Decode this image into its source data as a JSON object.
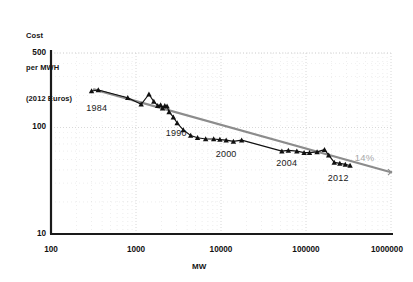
{
  "chart_data": {
    "type": "line",
    "title": "",
    "xlabel": "MW",
    "ylabel": "Cost\nper MWH\n(2012 Euros)",
    "ylabel_lines": [
      "Cost",
      "per MWH",
      "(2012 Euros)"
    ],
    "xscale": "log",
    "yscale": "log",
    "xlim": [
      100,
      1000000
    ],
    "ylim": [
      10,
      500
    ],
    "grid": true,
    "legend": "none",
    "xticks": [
      "100",
      "1000",
      "10000",
      "100000",
      "1000000"
    ],
    "xtick_values": [
      100,
      1000,
      10000,
      100000,
      1000000
    ],
    "yticks": [
      "10",
      "100",
      "500"
    ],
    "ytick_values": [
      10,
      100,
      500
    ],
    "series": [
      {
        "name": "Observed cost",
        "marker": "triangle",
        "color": "#111111",
        "x": [
          300,
          360,
          800,
          1150,
          1420,
          1620,
          1800,
          1950,
          2050,
          2180,
          2320,
          2450,
          2750,
          3050,
          3600,
          4400,
          5300,
          6600,
          8200,
          9700,
          11500,
          14000,
          17500,
          52000,
          62000,
          78000,
          95000,
          110000,
          135000,
          165000,
          185000,
          215000,
          250000,
          290000,
          330000
        ],
        "y": [
          220,
          225,
          190,
          165,
          205,
          175,
          160,
          163,
          152,
          160,
          158,
          140,
          125,
          110,
          95,
          84,
          80,
          78,
          78,
          77,
          76,
          74,
          76,
          60,
          61,
          60,
          58,
          58,
          59,
          62,
          55,
          47,
          46,
          45,
          44
        ]
      },
      {
        "name": "14% learning curve trend",
        "marker": "none",
        "color": "#8c8c8c",
        "x": [
          320,
          1000000
        ],
        "y": [
          228,
          38
        ]
      }
    ],
    "annotations": [
      {
        "text": "1984",
        "x": 360,
        "y": 150,
        "color": "#1a1a1a"
      },
      {
        "text": "1990",
        "x": 3100,
        "y": 86,
        "color": "#1a1a1a"
      },
      {
        "text": "2000",
        "x": 12000,
        "y": 55,
        "color": "#1a1a1a"
      },
      {
        "text": "2004",
        "x": 62000,
        "y": 45,
        "color": "#1a1a1a"
      },
      {
        "text": "2012",
        "x": 250000,
        "y": 33,
        "color": "#1a1a1a"
      },
      {
        "text": "14%",
        "x": 520000,
        "y": 52,
        "color": "#a8a8a8"
      }
    ],
    "colors": {
      "data": "#111111",
      "trend": "#8c8c8c",
      "axis": "#1a1a1a",
      "grid": "#cccccc",
      "annotation_muted": "#a8a8a8"
    }
  }
}
